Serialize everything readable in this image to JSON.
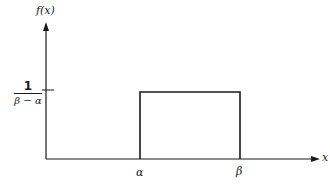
{
  "diagram": {
    "y_axis_label": "f(x)",
    "x_axis_label": "x",
    "y_tick": {
      "numerator": "1",
      "denominator": "β − α"
    },
    "x_ticks": [
      "α",
      "β"
    ],
    "line_color": "#1a1a1a"
  }
}
